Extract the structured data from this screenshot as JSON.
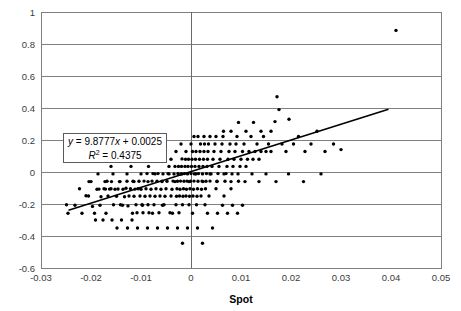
{
  "chart_data": {
    "type": "scatter",
    "title": "",
    "xlabel": "Spot",
    "ylabel": "",
    "xlim": [
      -0.03,
      0.05
    ],
    "ylim": [
      -0.6,
      1.0
    ],
    "xticks": [
      "-0.03",
      "-0.02",
      "-0.01",
      "0",
      "0.01",
      "0.02",
      "0.03",
      "0.04",
      "0.05"
    ],
    "xtick_values": [
      -0.03,
      -0.02,
      -0.01,
      0,
      0.01,
      0.02,
      0.03,
      0.04,
      0.05
    ],
    "yticks": [
      "-0.6",
      "-0.4",
      "-0.2",
      "0",
      "0.2",
      "0.4",
      "0.6",
      "0.8",
      "1"
    ],
    "ytick_values": [
      -0.6,
      -0.4,
      -0.2,
      0,
      0.2,
      0.4,
      0.6,
      0.8,
      1
    ],
    "grid": "horizontal",
    "legend": "none",
    "marker_color": "#000000",
    "marker_size": 2,
    "gridline_color": "#808080",
    "frame_color": "#808080",
    "trendline": {
      "equation": "y = 9.8777x + 0.0025",
      "r_squared_label": "R2 = 0.4375",
      "slope": 9.8777,
      "intercept": 0.0025,
      "r_squared": 0.4375,
      "x_start": -0.0245,
      "x_end": 0.0395,
      "color": "#000000"
    },
    "annotation": {
      "equation_text": "y = 9.8777x + 0.0025",
      "r2_text": "R",
      "r2_sup": "2",
      "r2_rest": " = 0.4375",
      "box_border": "#5a5a5a",
      "box_fill": "#ffffff"
    },
    "points": [
      [
        -0.0249,
        -0.205
      ],
      [
        -0.0223,
        -0.105
      ],
      [
        -0.021,
        -0.148
      ],
      [
        -0.0205,
        -0.15
      ],
      [
        -0.0197,
        -0.215
      ],
      [
        -0.0191,
        -0.3
      ],
      [
        -0.0188,
        -0.108
      ],
      [
        -0.0184,
        -0.107
      ],
      [
        -0.018,
        -0.155
      ],
      [
        -0.0176,
        -0.3
      ],
      [
        -0.0174,
        -0.105
      ],
      [
        -0.0171,
        -0.107
      ],
      [
        -0.0168,
        -0.058
      ],
      [
        -0.0166,
        -0.15
      ],
      [
        -0.0163,
        -0.107
      ],
      [
        -0.016,
        -0.105
      ],
      [
        -0.0158,
        -0.3
      ],
      [
        -0.0155,
        -0.205
      ],
      [
        -0.0152,
        -0.108
      ],
      [
        -0.0149,
        -0.152
      ],
      [
        -0.0146,
        -0.106
      ],
      [
        -0.0143,
        -0.06
      ],
      [
        -0.0141,
        -0.205
      ],
      [
        -0.0139,
        -0.3
      ],
      [
        -0.0136,
        -0.108
      ],
      [
        -0.0133,
        -0.155
      ],
      [
        -0.013,
        -0.102
      ],
      [
        -0.0128,
        -0.058
      ],
      [
        -0.0126,
        -0.212
      ],
      [
        -0.0124,
        -0.15
      ],
      [
        -0.0121,
        -0.105
      ],
      [
        -0.0118,
        -0.3
      ],
      [
        -0.0116,
        -0.058
      ],
      [
        -0.0114,
        -0.152
      ],
      [
        -0.0112,
        -0.107
      ],
      [
        -0.011,
        -0.205
      ],
      [
        -0.0108,
        -0.255
      ],
      [
        -0.0106,
        -0.105
      ],
      [
        -0.0104,
        -0.058
      ],
      [
        -0.0102,
        -0.15
      ],
      [
        -0.01,
        -0.108
      ],
      [
        -0.0098,
        -0.205
      ],
      [
        -0.0096,
        -0.255
      ],
      [
        -0.0094,
        -0.057
      ],
      [
        -0.0092,
        -0.152
      ],
      [
        -0.009,
        -0.105
      ],
      [
        -0.0088,
        -0.01
      ],
      [
        -0.0086,
        -0.205
      ],
      [
        -0.0084,
        -0.255
      ],
      [
        -0.0082,
        -0.15
      ],
      [
        -0.008,
        -0.108
      ],
      [
        -0.0078,
        -0.057
      ],
      [
        -0.0076,
        -0.01
      ],
      [
        -0.0074,
        -0.205
      ],
      [
        -0.0072,
        -0.152
      ],
      [
        -0.007,
        -0.105
      ],
      [
        -0.0068,
        -0.058
      ],
      [
        -0.0066,
        -0.01
      ],
      [
        -0.0064,
        -0.255
      ],
      [
        -0.0062,
        -0.15
      ],
      [
        -0.006,
        -0.108
      ],
      [
        -0.0058,
        -0.057
      ],
      [
        -0.0056,
        -0.012
      ],
      [
        -0.0054,
        -0.205
      ],
      [
        -0.0052,
        -0.152
      ],
      [
        -0.005,
        -0.105
      ],
      [
        -0.0048,
        -0.058
      ],
      [
        -0.0046,
        -0.01
      ],
      [
        -0.0044,
        0.035
      ],
      [
        -0.0042,
        -0.255
      ],
      [
        -0.004,
        -0.15
      ],
      [
        -0.0038,
        -0.108
      ],
      [
        -0.0036,
        -0.057
      ],
      [
        -0.0034,
        -0.012
      ],
      [
        -0.0032,
        0.035
      ],
      [
        -0.003,
        -0.205
      ],
      [
        -0.0029,
        -0.152
      ],
      [
        -0.0028,
        -0.105
      ],
      [
        -0.0027,
        -0.058
      ],
      [
        -0.0026,
        -0.01
      ],
      [
        -0.0025,
        0.035
      ],
      [
        -0.0024,
        -0.255
      ],
      [
        -0.0023,
        -0.15
      ],
      [
        -0.0022,
        -0.108
      ],
      [
        -0.0021,
        -0.057
      ],
      [
        -0.002,
        -0.012
      ],
      [
        -0.0019,
        0.035
      ],
      [
        -0.0018,
        0.082
      ],
      [
        -0.0017,
        -0.205
      ],
      [
        -0.0016,
        -0.152
      ],
      [
        -0.0015,
        -0.105
      ],
      [
        -0.0014,
        -0.058
      ],
      [
        -0.0013,
        -0.01
      ],
      [
        -0.0012,
        0.035
      ],
      [
        -0.0011,
        0.08
      ],
      [
        -0.001,
        -0.15
      ],
      [
        -0.0009,
        -0.108
      ],
      [
        -0.0008,
        -0.057
      ],
      [
        -0.0007,
        -0.012
      ],
      [
        -0.0006,
        0.035
      ],
      [
        -0.0005,
        0.08
      ],
      [
        -0.0004,
        -0.205
      ],
      [
        -0.0003,
        -0.152
      ],
      [
        -0.0002,
        -0.105
      ],
      [
        -0.0001,
        -0.058
      ],
      [
        0.0,
        -0.01
      ],
      [
        0.0001,
        0.035
      ],
      [
        0.0002,
        0.08
      ],
      [
        0.0003,
        0.128
      ],
      [
        0.0004,
        -0.15
      ],
      [
        0.0005,
        -0.108
      ],
      [
        0.0006,
        -0.057
      ],
      [
        0.0007,
        -0.012
      ],
      [
        0.0008,
        0.035
      ],
      [
        0.0009,
        0.08
      ],
      [
        0.001,
        0.128
      ],
      [
        0.0011,
        -0.205
      ],
      [
        0.0012,
        -0.152
      ],
      [
        0.0013,
        -0.105
      ],
      [
        0.0014,
        -0.058
      ],
      [
        0.0015,
        -0.01
      ],
      [
        0.0016,
        0.035
      ],
      [
        0.0017,
        0.08
      ],
      [
        0.0018,
        0.128
      ],
      [
        0.0019,
        0.175
      ],
      [
        0.002,
        -0.15
      ],
      [
        0.0021,
        -0.108
      ],
      [
        0.0022,
        -0.057
      ],
      [
        0.0023,
        -0.012
      ],
      [
        0.0024,
        0.035
      ],
      [
        0.0025,
        0.08
      ],
      [
        0.0026,
        0.128
      ],
      [
        0.0027,
        0.175
      ],
      [
        0.0028,
        -0.205
      ],
      [
        0.0029,
        -0.105
      ],
      [
        0.003,
        -0.058
      ],
      [
        0.0031,
        -0.01
      ],
      [
        0.0032,
        0.035
      ],
      [
        0.0033,
        0.08
      ],
      [
        0.0034,
        0.128
      ],
      [
        0.0035,
        0.175
      ],
      [
        0.0036,
        -0.15
      ],
      [
        0.0038,
        -0.057
      ],
      [
        0.004,
        -0.012
      ],
      [
        0.0042,
        0.035
      ],
      [
        0.0044,
        0.08
      ],
      [
        0.0046,
        0.128
      ],
      [
        0.0048,
        0.175
      ],
      [
        0.005,
        -0.105
      ],
      [
        0.0052,
        -0.058
      ],
      [
        0.0054,
        -0.01
      ],
      [
        0.0056,
        0.035
      ],
      [
        0.0058,
        0.08
      ],
      [
        0.006,
        0.128
      ],
      [
        0.0062,
        0.175
      ],
      [
        0.0064,
        0.222
      ],
      [
        0.0066,
        -0.15
      ],
      [
        0.0068,
        -0.058
      ],
      [
        0.007,
        -0.01
      ],
      [
        0.0072,
        0.035
      ],
      [
        0.0074,
        0.08
      ],
      [
        0.0076,
        0.128
      ],
      [
        0.0078,
        0.175
      ],
      [
        0.008,
        -0.105
      ],
      [
        0.0082,
        -0.012
      ],
      [
        0.0084,
        0.035
      ],
      [
        0.0086,
        0.08
      ],
      [
        0.0088,
        0.128
      ],
      [
        0.009,
        0.175
      ],
      [
        0.0092,
        0.222
      ],
      [
        0.0095,
        -0.058
      ],
      [
        0.0098,
        0.035
      ],
      [
        0.01,
        0.08
      ],
      [
        0.0103,
        0.128
      ],
      [
        0.0106,
        0.175
      ],
      [
        0.011,
        0.035
      ],
      [
        0.0113,
        0.08
      ],
      [
        0.0116,
        0.128
      ],
      [
        0.012,
        0.222
      ],
      [
        0.0124,
        0.08
      ],
      [
        0.0128,
        0.128
      ],
      [
        0.0132,
        0.175
      ],
      [
        0.0136,
        0.08
      ],
      [
        0.014,
        0.128
      ],
      [
        0.0145,
        0.222
      ],
      [
        0.015,
        0.128
      ],
      [
        0.0155,
        0.175
      ],
      [
        0.016,
        0.128
      ],
      [
        0.0168,
        0.315
      ],
      [
        0.0172,
        0.47
      ],
      [
        0.0176,
        0.39
      ],
      [
        0.0182,
        0.175
      ],
      [
        0.019,
        0.128
      ],
      [
        0.0196,
        0.33
      ],
      [
        0.0205,
        0.175
      ],
      [
        0.0215,
        0.222
      ],
      [
        0.0228,
        0.128
      ],
      [
        0.024,
        0.175
      ],
      [
        0.0252,
        0.255
      ],
      [
        0.0268,
        0.128
      ],
      [
        0.0285,
        0.175
      ],
      [
        0.03,
        0.14
      ],
      [
        0.041,
        0.885
      ],
      [
        -0.0246,
        -0.258
      ],
      [
        -0.0232,
        -0.208
      ],
      [
        -0.0218,
        -0.258
      ],
      [
        -0.0204,
        -0.06
      ],
      [
        -0.0193,
        -0.258
      ],
      [
        -0.0182,
        -0.208
      ],
      [
        -0.017,
        -0.258
      ],
      [
        -0.0159,
        -0.06
      ],
      [
        -0.0148,
        -0.35
      ],
      [
        -0.0137,
        -0.208
      ],
      [
        -0.0127,
        -0.35
      ],
      [
        -0.0117,
        -0.258
      ],
      [
        -0.0107,
        -0.35
      ],
      [
        -0.0097,
        -0.208
      ],
      [
        -0.0087,
        -0.35
      ],
      [
        -0.0077,
        -0.258
      ],
      [
        -0.0067,
        -0.35
      ],
      [
        -0.0057,
        -0.208
      ],
      [
        -0.0047,
        -0.35
      ],
      [
        -0.0037,
        -0.258
      ],
      [
        -0.0027,
        -0.35
      ],
      [
        -0.0017,
        -0.445
      ],
      [
        -0.0007,
        -0.35
      ],
      [
        0.0003,
        -0.258
      ],
      [
        0.0013,
        -0.35
      ],
      [
        0.0023,
        -0.445
      ],
      [
        0.0033,
        -0.258
      ],
      [
        0.0043,
        -0.35
      ],
      [
        0.0053,
        -0.258
      ],
      [
        0.0063,
        -0.208
      ],
      [
        0.0073,
        -0.258
      ],
      [
        0.0083,
        -0.208
      ],
      [
        0.0093,
        -0.258
      ],
      [
        0.0103,
        -0.208
      ],
      [
        -0.016,
        0.035
      ],
      [
        -0.014,
        0.08
      ],
      [
        -0.012,
        0.035
      ],
      [
        -0.01,
        0.08
      ],
      [
        -0.0085,
        0.035
      ],
      [
        -0.007,
        0.08
      ],
      [
        -0.0055,
        0.128
      ],
      [
        -0.004,
        0.08
      ],
      [
        -0.003,
        0.128
      ],
      [
        -0.002,
        0.175
      ],
      [
        -0.001,
        0.128
      ],
      [
        0.0,
        0.175
      ],
      [
        0.0006,
        0.222
      ],
      [
        0.0014,
        0.222
      ],
      [
        0.0026,
        0.222
      ],
      [
        0.0038,
        0.222
      ],
      [
        0.005,
        0.222
      ],
      [
        0.0065,
        0.255
      ],
      [
        0.008,
        0.255
      ],
      [
        0.0095,
        0.31
      ],
      [
        0.011,
        0.255
      ],
      [
        0.0125,
        0.31
      ],
      [
        0.014,
        0.255
      ],
      [
        0.016,
        0.255
      ],
      [
        -0.02,
        -0.06
      ],
      [
        -0.0186,
        -0.012
      ],
      [
        -0.0172,
        -0.06
      ],
      [
        -0.0156,
        -0.012
      ],
      [
        -0.0142,
        -0.06
      ],
      [
        -0.0128,
        -0.012
      ],
      [
        -0.0114,
        -0.06
      ],
      [
        -0.01,
        -0.012
      ],
      [
        -0.0086,
        -0.06
      ],
      [
        -0.0072,
        -0.012
      ],
      [
        -0.0058,
        -0.06
      ],
      [
        -0.0044,
        -0.012
      ],
      [
        -0.0032,
        -0.06
      ],
      [
        -0.0018,
        -0.012
      ],
      [
        -0.0004,
        -0.06
      ],
      [
        0.001,
        -0.012
      ],
      [
        0.0024,
        -0.06
      ],
      [
        0.0038,
        -0.012
      ],
      [
        0.0052,
        -0.06
      ],
      [
        0.0066,
        -0.012
      ],
      [
        0.008,
        -0.06
      ],
      [
        0.0094,
        -0.012
      ],
      [
        0.0108,
        -0.06
      ],
      [
        0.0122,
        -0.012
      ],
      [
        0.0136,
        -0.06
      ],
      [
        0.015,
        -0.012
      ],
      [
        0.017,
        -0.06
      ],
      [
        0.0195,
        -0.012
      ],
      [
        0.0225,
        -0.06
      ],
      [
        0.026,
        -0.012
      ]
    ]
  }
}
